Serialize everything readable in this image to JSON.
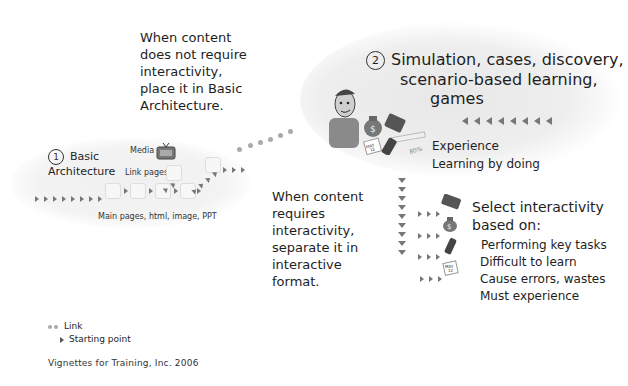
{
  "notes": {
    "no_interactivity": [
      "When content",
      "does not require",
      "interactivity,",
      "place it in Basic",
      "Architecture."
    ],
    "requires_interactivity": [
      "When content",
      "requires",
      "interactivity,",
      "separate it in",
      "interactive",
      "format."
    ]
  },
  "section1": {
    "number": "1",
    "title_line1": "Basic",
    "title_line2": "Architecture",
    "labels": {
      "media": "Media",
      "link_pages": "Link pages",
      "main_pages": "Main pages, html,  image, PPT"
    }
  },
  "section2": {
    "number": "2",
    "title_lines": [
      "Simulation, cases, discovery,",
      "scenario-based learning,",
      "games"
    ],
    "subtitle_lines": [
      "Experience",
      "Learning by doing"
    ],
    "icon_labels": {
      "calendar": "MAY 12",
      "progress": "80%"
    }
  },
  "selection": {
    "title_lines": [
      "Select interactivity",
      "based on:"
    ],
    "criteria": [
      "Performing key tasks",
      "Difficult to learn",
      "Cause errors, wastes",
      "Must experience"
    ]
  },
  "legend": {
    "link": "Link",
    "starting_point": "Starting point"
  },
  "footer": "Vignettes for Training, Inc. 2006"
}
